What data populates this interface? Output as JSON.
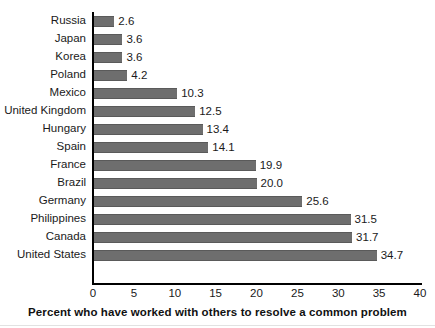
{
  "chart_data": {
    "type": "bar",
    "orientation": "horizontal",
    "title": "",
    "xlabel": "Percent who have worked with others to resolve a common problem",
    "ylabel": "",
    "xlim": [
      0,
      40
    ],
    "xticks": [
      0,
      5,
      10,
      15,
      20,
      25,
      30,
      35,
      40
    ],
    "grid": false,
    "legend": false,
    "bar_color": "#6e6e6e",
    "axis_color": "#000000",
    "categories": [
      "Russia",
      "Japan",
      "Korea",
      "Poland",
      "Mexico",
      "United Kingdom",
      "Hungary",
      "Spain",
      "France",
      "Brazil",
      "Germany",
      "Philippines",
      "Canada",
      "United States"
    ],
    "values": [
      2.6,
      3.6,
      3.6,
      4.2,
      10.3,
      12.5,
      13.4,
      14.1,
      19.9,
      20.0,
      25.6,
      31.5,
      31.7,
      34.7
    ],
    "value_labels": [
      "2.6",
      "3.6",
      "3.6",
      "4.2",
      "10.3",
      "12.5",
      "13.4",
      "14.1",
      "19.9",
      "20.0",
      "25.6",
      "31.5",
      "31.7",
      "34.7"
    ],
    "tick_labels": [
      "0",
      "5",
      "10",
      "15",
      "20",
      "25",
      "30",
      "35",
      "40"
    ]
  }
}
